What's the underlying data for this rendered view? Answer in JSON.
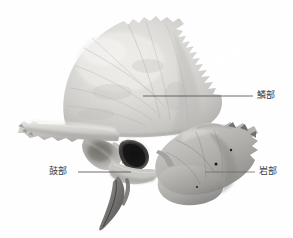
{
  "figure": {
    "kind": "anatomical-photograph",
    "background_color": "#ffffff",
    "width": 293,
    "height": 238
  },
  "annotations": {
    "squamous": {
      "label": "鱗部",
      "leader_line": {
        "x1": 143,
        "y1": 96,
        "x2": 253,
        "y2": 96
      },
      "text_color": "#3a3a3a",
      "line_color": "#4a4a4a"
    },
    "tympanic": {
      "label": "鼓部",
      "leader_line": {
        "x1": 78,
        "y1": 172,
        "x2": 131,
        "y2": 172
      },
      "text_color": "#3a3a3a",
      "line_color": "#4a4a4a"
    },
    "petrous": {
      "label": "岩部",
      "leader_line": {
        "x1": 205,
        "y1": 172,
        "x2": 255,
        "y2": 172
      },
      "text_color": "#3a3a3a",
      "line_color": "#6a6a6a"
    }
  },
  "specimen": {
    "palette": {
      "bone_light": "#e3e2df",
      "bone_mid": "#cfcecb",
      "bone_shade": "#b3b2af",
      "bone_dark": "#8e8d8a",
      "bone_deep": "#5d5c5a",
      "cavity_black": "#1e1e1e"
    },
    "regions": [
      {
        "name": "squamous-part",
        "note": "large fan-shaped plate, serrated superior margin"
      },
      {
        "name": "zygomatic-process",
        "note": "anterior projecting bar to the left"
      },
      {
        "name": "mandibular-fossa",
        "note": "hollow below zygomatic root"
      },
      {
        "name": "external-acoustic-meatus",
        "note": "dark oval opening"
      },
      {
        "name": "styloid-process",
        "note": "thin needle projecting inferiorly"
      },
      {
        "name": "petrous-part",
        "note": "dense mass at lower right"
      },
      {
        "name": "mastoid-region",
        "note": "lower right textured mass"
      }
    ]
  }
}
